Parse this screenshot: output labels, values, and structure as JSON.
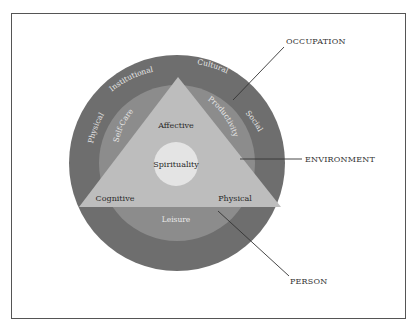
{
  "diagram": {
    "type": "concentric-model",
    "colors": {
      "frame_border": "#555555",
      "occupation_ring": "#6e6e6e",
      "environment_ring": "#8c8c8c",
      "person_triangle": "#bdbdbd",
      "spirituality_circle": "#e4e4e4",
      "leader_lines": "#333333"
    },
    "external_labels": {
      "occupation": "OCCUPATION",
      "environment": "ENVIRONMENT",
      "person": "PERSON"
    },
    "occupation_ring": {
      "labels": [
        "Physical",
        "Institutional",
        "Cultural",
        "Social"
      ]
    },
    "environment_ring": {
      "labels": [
        "Self-Care",
        "Productivity",
        "Leisure"
      ]
    },
    "person_triangle": {
      "labels": [
        "Affective",
        "Cognitive",
        "Physical"
      ]
    },
    "core": {
      "label": "Spirituality"
    }
  }
}
